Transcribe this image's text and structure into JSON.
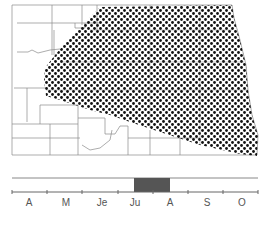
{
  "map": {
    "region": "state outline with county boundaries",
    "range_pattern": "dotted",
    "colors": {
      "outline": "#8a8a8a",
      "dots": "#111111",
      "background": "#ffffff"
    }
  },
  "timeline": {
    "months": [
      "A",
      "M",
      "Je",
      "Ju",
      "A",
      "S",
      "O"
    ],
    "active_period": {
      "start": "Ju",
      "end": "A",
      "color": "#555555"
    }
  }
}
